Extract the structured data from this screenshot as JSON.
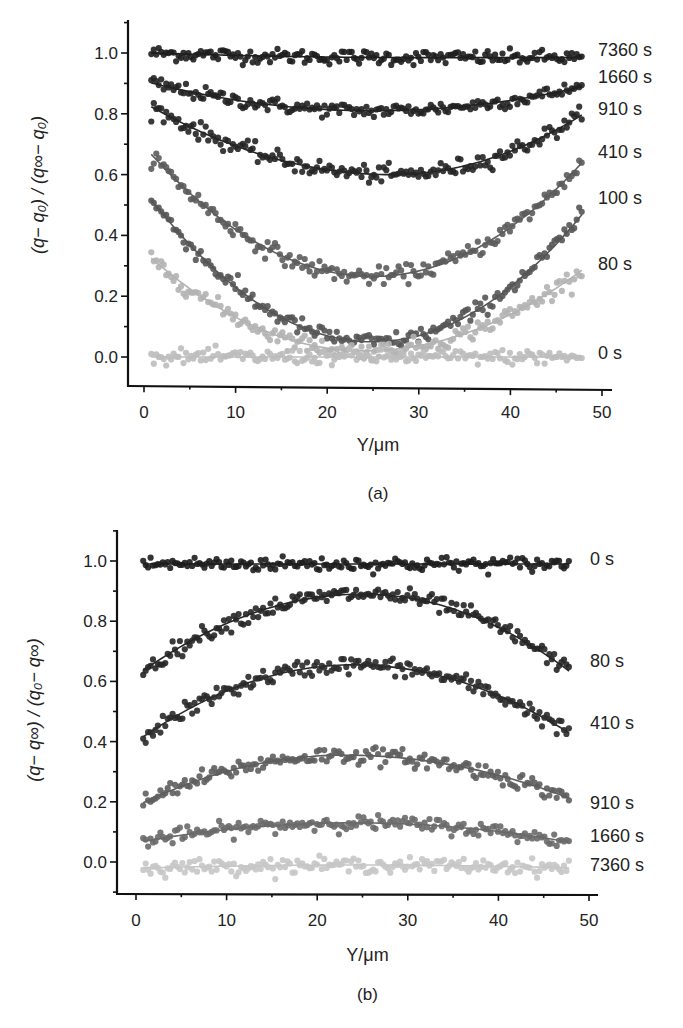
{
  "chart_data": [
    {
      "type": "scatter",
      "panel_label": "(a)",
      "xlabel": "Y/μm",
      "ylabel": "(q− q₀) / (q∞− q₀)",
      "xlim": [
        -2,
        50
      ],
      "ylim": [
        -0.1,
        1.1
      ],
      "xticks": [
        0,
        10,
        20,
        30,
        40,
        50
      ],
      "xtick_labels": [
        "0",
        "10",
        "20",
        "30",
        "40",
        "50"
      ],
      "yticks": [
        0.0,
        0.2,
        0.4,
        0.6,
        0.8,
        1.0
      ],
      "ytick_labels": [
        "0.0",
        "0.2",
        "0.4",
        "0.6",
        "0.8",
        "1.0"
      ],
      "grid": false,
      "legend": "inline-right",
      "series": [
        {
          "name": "7360 s",
          "color": "#1e1e1e",
          "fit": {
            "start": 1.0,
            "min": 0.985,
            "min_x": 30,
            "end": 0.985
          },
          "label_value": 1.01
        },
        {
          "name": "1660 s",
          "color": "#222222",
          "fit": {
            "start": 0.9,
            "min": 0.81,
            "min_x": 25,
            "end": 0.89
          },
          "label_value": 0.935
        },
        {
          "name": "910 s",
          "color": "#252525",
          "fit": {
            "start": 0.82,
            "min": 0.6,
            "min_x": 27,
            "end": 0.8
          },
          "label_value": 0.81
        },
        {
          "name": "410 s",
          "color": "#5c5c5c",
          "fit": {
            "start": 0.66,
            "min": 0.265,
            "min_x": 25,
            "end": 0.645
          },
          "label_value": 0.67
        },
        {
          "name": "100 s",
          "color": "#555555",
          "fit": {
            "start": 0.51,
            "min": 0.05,
            "min_x": 25,
            "end": 0.475
          },
          "label_value": 0.52
        },
        {
          "name": "80 s",
          "color": "#b3b3b3",
          "fit": {
            "start": 0.32,
            "min": 0.02,
            "min_x": 24,
            "end": 0.29
          },
          "label_value": 0.3
        },
        {
          "name": "0 s",
          "color": "#bdbdbd",
          "fit": {
            "start": 0.0,
            "min": 0.0,
            "min_x": 25,
            "end": 0.0
          },
          "label_value": 0.01
        }
      ]
    },
    {
      "type": "scatter",
      "panel_label": "(b)",
      "xlabel": "Y/μm",
      "ylabel": "(q− q∞) / (q₀− q∞)",
      "xlim": [
        -2,
        50
      ],
      "ylim": [
        -0.1,
        1.1
      ],
      "xticks": [
        0,
        10,
        20,
        30,
        40,
        50
      ],
      "xtick_labels": [
        "0",
        "10",
        "20",
        "30",
        "40",
        "50"
      ],
      "yticks": [
        0.0,
        0.2,
        0.4,
        0.6,
        0.8,
        1.0
      ],
      "ytick_labels": [
        "0.0",
        "0.2",
        "0.4",
        "0.6",
        "0.8",
        "1.0"
      ],
      "grid": false,
      "legend": "inline-right",
      "series": [
        {
          "name": "0 s",
          "color": "#1e1e1e",
          "fit": {
            "start": 0.99,
            "peak": 0.99,
            "peak_x": 25,
            "end": 0.99
          },
          "label_value": 1.0
        },
        {
          "name": "80 s",
          "color": "#262626",
          "fit": {
            "start": 0.64,
            "peak": 0.89,
            "peak_x": 25,
            "end": 0.63
          },
          "label_value": 0.66
        },
        {
          "name": "410 s",
          "color": "#2a2a2a",
          "fit": {
            "start": 0.42,
            "peak": 0.655,
            "peak_x": 24,
            "end": 0.425
          },
          "label_value": 0.46
        },
        {
          "name": "910 s",
          "color": "#5e5e5e",
          "fit": {
            "start": 0.2,
            "peak": 0.355,
            "peak_x": 23,
            "end": 0.21
          },
          "label_value": 0.195
        },
        {
          "name": "1660 s",
          "color": "#6a6a6a",
          "fit": {
            "start": 0.07,
            "peak": 0.13,
            "peak_x": 24,
            "end": 0.065
          },
          "label_value": 0.085
        },
        {
          "name": "7360 s",
          "color": "#c6c6c6",
          "fit": {
            "start": -0.02,
            "peak": -0.01,
            "peak_x": 25,
            "end": -0.02
          },
          "label_value": -0.01
        }
      ]
    }
  ]
}
